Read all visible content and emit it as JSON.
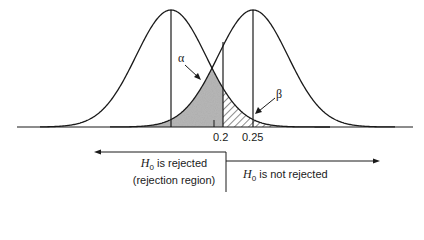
{
  "diagram": {
    "type": "hypothesis-test-error-regions",
    "colors": {
      "line": "#1a1a1a",
      "alpha_fill": "#b8b8b8",
      "beta_hatch": "#1a1a1a",
      "background": "#ffffff"
    },
    "curves": [
      {
        "name": "null-distribution",
        "peak_x": 171
      },
      {
        "name": "alternative-distribution",
        "peak_x": 253
      }
    ],
    "labels": {
      "alpha": "α",
      "beta": "β",
      "tick_critical": "0.2",
      "tick_alt_mean": "0.25"
    },
    "regions": {
      "rejected": {
        "symbol": "H",
        "subscript": "0",
        "line1_rest": " is rejected",
        "line2": "(rejection region)"
      },
      "not_rejected": {
        "symbol": "H",
        "subscript": "0",
        "rest": " is not rejected"
      }
    }
  }
}
